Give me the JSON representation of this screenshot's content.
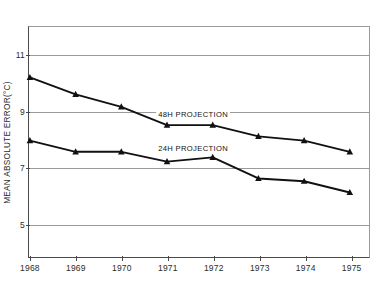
{
  "chart_data": {
    "type": "line",
    "title": "",
    "subtitle": "",
    "xlabel": "",
    "ylabel": "MEAN ABSOLUTE ERROR(°C)",
    "categories": [
      "1968",
      "1969",
      "1970",
      "1971",
      "1972",
      "1973",
      "1974",
      "1975"
    ],
    "x": [
      1968,
      1969,
      1970,
      1971,
      1972,
      1973,
      1974,
      1975
    ],
    "xlim": [
      1967.98,
      1975.42
    ],
    "ylim": [
      3.8,
      12.0
    ],
    "yticks": [
      5,
      7,
      9,
      11
    ],
    "ytick_labels": [
      "5",
      "7",
      "9",
      "11"
    ],
    "grid": "horizontal",
    "legend_position": "inline-annotations",
    "marker": "triangle-up",
    "marker_color": "#111111",
    "line_color": "#111111",
    "series": [
      {
        "name": "48H PROJECTION",
        "label": "48H PROJECTION",
        "values": [
          10.2,
          9.6,
          9.15,
          8.5,
          8.5,
          8.1,
          7.95,
          7.55
        ]
      },
      {
        "name": "24H PROJECTION",
        "label": "24H PROJECTION",
        "values": [
          7.95,
          7.55,
          7.55,
          7.2,
          7.35,
          6.6,
          6.5,
          6.1
        ]
      }
    ],
    "annotations": [
      {
        "text": "48H PROJECTION",
        "x": 1971.55,
        "y": 8.92
      },
      {
        "text": "24H PROJECTION",
        "x": 1971.55,
        "y": 7.72
      }
    ],
    "colors": {
      "background": "#ffffff",
      "axis": "#4a4a4a",
      "grid": "#9a9a9a",
      "text": "#2b2b2b",
      "series": "#111111"
    }
  }
}
